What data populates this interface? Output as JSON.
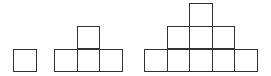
{
  "diagram": {
    "cell_size": 22.6,
    "stroke_color": "#333333",
    "fill_color": "#ffffff",
    "background": "#ffffff",
    "figures": [
      {
        "index": 1,
        "square_count": 1,
        "rows_bottom_to_top": [
          1
        ],
        "cells": [
          [
            13,
            48.5
          ]
        ]
      },
      {
        "index": 2,
        "square_count": 4,
        "rows_bottom_to_top": [
          3,
          1
        ],
        "cells": [
          [
            54,
            48.5
          ],
          [
            76.6,
            48.5
          ],
          [
            99.2,
            48.5
          ],
          [
            76.6,
            25.9
          ]
        ]
      },
      {
        "index": 3,
        "square_count": 9,
        "rows_bottom_to_top": [
          5,
          3,
          1
        ],
        "cells": [
          [
            144,
            48.5
          ],
          [
            166.6,
            48.5
          ],
          [
            189.2,
            48.5
          ],
          [
            211.8,
            48.5
          ],
          [
            234.4,
            48.5
          ],
          [
            166.6,
            25.9
          ],
          [
            189.2,
            25.9
          ],
          [
            211.8,
            25.9
          ],
          [
            189.2,
            3.3
          ]
        ]
      }
    ]
  }
}
